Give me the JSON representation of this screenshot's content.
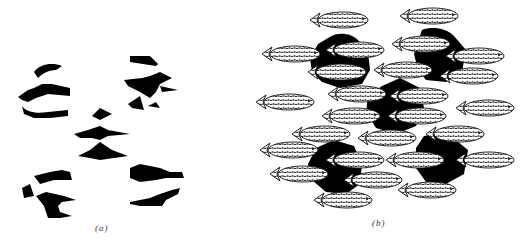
{
  "figure": {
    "panels": [
      {
        "id": "a",
        "caption": "(a)",
        "description": "Five clusters of disconnected black fragments (occluded shapes shown without occluders)"
      },
      {
        "id": "b",
        "caption": "(b)",
        "description": "Same black fragments with patterned fish occluders overlaid, revealing five black shapes behind the fish"
      }
    ],
    "colors": {
      "background": "#ffffff",
      "fragments": "#000000",
      "fish_fill": "#ffffff",
      "fish_pattern": "#222222"
    }
  }
}
